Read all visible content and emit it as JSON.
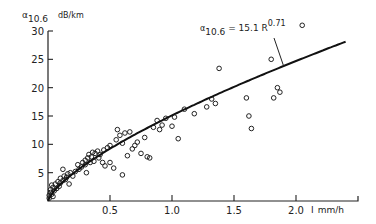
{
  "chart_data": {
    "type": "scatter",
    "title": "",
    "ylabel": "α10.6 dB/km",
    "ylabel_main": "α",
    "ylabel_sub": "10.6",
    "ylabel_unit": "dB/km",
    "xlabel": "mm/h",
    "xlabel_prefix": "I",
    "xlim": [
      0,
      2.5
    ],
    "ylim": [
      0,
      30
    ],
    "grid": false,
    "x_ticks": [
      0.5,
      1.0,
      1.5,
      2.0
    ],
    "x_tick_labels": [
      "0.5",
      "1.0",
      "1.5",
      "2.0"
    ],
    "y_ticks": [
      5,
      10,
      15,
      20,
      25,
      30
    ],
    "y_tick_labels": [
      "5",
      "10",
      "15",
      "20",
      "25",
      "30"
    ],
    "annotation": {
      "text_main": "α",
      "text_sub": "10.6",
      "text_eq": " = 15.1 R",
      "text_exp": "0.71",
      "points_to": [
        1.9,
        25.4
      ]
    },
    "fit_curve": {
      "name": "α10.6 = 15.1 R^0.71",
      "coef": 15.1,
      "exponent": 0.71,
      "x_range": [
        0.0,
        2.4
      ]
    },
    "series": [
      {
        "name": "measurements",
        "marker": "open-circle",
        "points": [
          [
            0.01,
            0.5
          ],
          [
            0.01,
            1.0
          ],
          [
            0.02,
            1.5
          ],
          [
            0.02,
            2.0
          ],
          [
            0.03,
            1.2
          ],
          [
            0.03,
            2.8
          ],
          [
            0.04,
            0.8
          ],
          [
            0.04,
            2.4
          ],
          [
            0.05,
            1.8
          ],
          [
            0.06,
            3.0
          ],
          [
            0.07,
            2.2
          ],
          [
            0.08,
            3.4
          ],
          [
            0.09,
            2.6
          ],
          [
            0.1,
            4.0
          ],
          [
            0.1,
            3.2
          ],
          [
            0.12,
            3.6
          ],
          [
            0.12,
            5.6
          ],
          [
            0.13,
            4.4
          ],
          [
            0.14,
            3.8
          ],
          [
            0.15,
            4.2
          ],
          [
            0.16,
            4.8
          ],
          [
            0.17,
            3.0
          ],
          [
            0.18,
            5.0
          ],
          [
            0.2,
            4.4
          ],
          [
            0.22,
            5.2
          ],
          [
            0.24,
            6.4
          ],
          [
            0.25,
            5.6
          ],
          [
            0.27,
            6.0
          ],
          [
            0.28,
            6.8
          ],
          [
            0.3,
            6.4
          ],
          [
            0.3,
            7.2
          ],
          [
            0.31,
            5.0
          ],
          [
            0.32,
            7.6
          ],
          [
            0.33,
            8.2
          ],
          [
            0.34,
            6.8
          ],
          [
            0.35,
            7.8
          ],
          [
            0.36,
            8.6
          ],
          [
            0.37,
            7.0
          ],
          [
            0.38,
            8.4
          ],
          [
            0.4,
            8.8
          ],
          [
            0.41,
            7.6
          ],
          [
            0.42,
            8.2
          ],
          [
            0.44,
            6.8
          ],
          [
            0.45,
            9.0
          ],
          [
            0.46,
            6.2
          ],
          [
            0.48,
            9.4
          ],
          [
            0.5,
            6.8
          ],
          [
            0.5,
            9.8
          ],
          [
            0.53,
            5.8
          ],
          [
            0.55,
            10.8
          ],
          [
            0.56,
            12.6
          ],
          [
            0.58,
            11.6
          ],
          [
            0.6,
            10.2
          ],
          [
            0.6,
            4.6
          ],
          [
            0.62,
            12.0
          ],
          [
            0.64,
            8.0
          ],
          [
            0.66,
            12.2
          ],
          [
            0.68,
            9.2
          ],
          [
            0.7,
            9.8
          ],
          [
            0.72,
            10.4
          ],
          [
            0.75,
            8.4
          ],
          [
            0.78,
            11.2
          ],
          [
            0.8,
            7.8
          ],
          [
            0.82,
            7.6
          ],
          [
            0.85,
            13.0
          ],
          [
            0.88,
            14.2
          ],
          [
            0.9,
            12.6
          ],
          [
            0.92,
            13.4
          ],
          [
            0.95,
            14.6
          ],
          [
            1.0,
            13.2
          ],
          [
            1.02,
            14.8
          ],
          [
            1.05,
            11.0
          ],
          [
            1.1,
            16.2
          ],
          [
            1.18,
            15.4
          ],
          [
            1.28,
            16.6
          ],
          [
            1.32,
            18.0
          ],
          [
            1.35,
            17.2
          ],
          [
            1.38,
            23.4
          ],
          [
            1.6,
            18.2
          ],
          [
            1.62,
            15.0
          ],
          [
            1.64,
            12.8
          ],
          [
            1.8,
            25.0
          ],
          [
            1.82,
            18.2
          ],
          [
            1.85,
            20.0
          ],
          [
            1.87,
            19.2
          ],
          [
            2.05,
            31.0
          ]
        ]
      }
    ]
  }
}
